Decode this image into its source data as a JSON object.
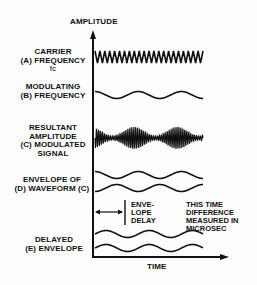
{
  "diagram": {
    "y_axis_label": "AMPLITUDE",
    "x_axis_label": "TIME",
    "rows": [
      {
        "id": "A",
        "lines": [
          "CARRIER",
          "(A) FREQUENCY",
          "fc"
        ]
      },
      {
        "id": "B",
        "lines": [
          "MODULATING",
          "(B) FREQUENCY"
        ]
      },
      {
        "id": "C",
        "lines": [
          "RESULTANT",
          "AMPLITUDE",
          "(C) MODULATED",
          "SIGNAL"
        ]
      },
      {
        "id": "D",
        "lines": [
          "ENVELOPE OF",
          "(D) WAVEFORM (C)"
        ]
      },
      {
        "id": "E",
        "lines": [
          "DELAYED",
          "(E) ENVELOPE"
        ]
      }
    ],
    "delay_label": [
      "ENVE-",
      "LOPE",
      "DELAY"
    ],
    "note": [
      "THIS TIME",
      "DIFFERENCE",
      "MEASURED IN",
      "MICROSEC"
    ],
    "colors": {
      "ink": "#111111",
      "background": "#fdfdfd"
    }
  }
}
